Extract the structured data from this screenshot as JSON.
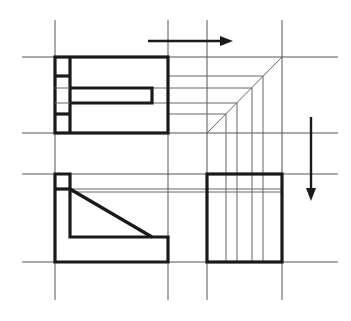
{
  "diagram": {
    "type": "orthographic-projection",
    "colors": {
      "outline": "#1a1a1a",
      "construction": "#555555",
      "background": "#ffffff"
    },
    "grid": {
      "vertical_x": [
        55,
        168,
        207,
        282
      ],
      "horizontal_y": [
        57,
        133,
        174,
        262
      ]
    },
    "views": [
      {
        "name": "top-view",
        "shape": "rectangle with left strip and horizontal slot"
      },
      {
        "name": "front-view",
        "shape": "L-profile with triangular rib"
      },
      {
        "name": "side-view",
        "shape": "rectangle with vertical projected lines"
      }
    ],
    "arrows": [
      {
        "name": "projection-arrow-right",
        "direction": "right"
      },
      {
        "name": "projection-arrow-down",
        "direction": "down"
      }
    ],
    "miter_line": {
      "from": [
        207,
        133
      ],
      "to": [
        282,
        57
      ]
    },
    "transfer_lines_y": [
      76,
      88,
      103,
      114
    ],
    "transfer_lines_x": [
      226,
      237,
      252,
      263
    ]
  }
}
